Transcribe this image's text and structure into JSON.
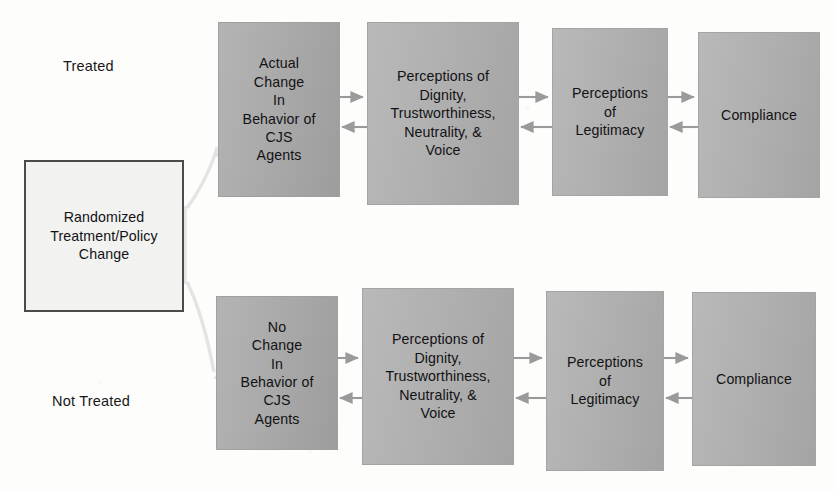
{
  "figure": {
    "title": "Randomized Treatment / Procedural Justice Legitimacy Model",
    "background_color": "#fdfdfc",
    "box_fill_color": "#aaaaaa",
    "box_border_color": "#a0a0a0",
    "source_box_fill_color": "#f2f2f0",
    "source_box_border_color": "#4b4b4b",
    "arrow_color": "#9a9a9a",
    "fork_line_color": "#e2e2e2",
    "text_color": "#121214"
  },
  "group_labels": {
    "treated": "Treated",
    "not_treated": "Not Treated"
  },
  "source": {
    "label": "Randomized\nTreatment/Policy\nChange",
    "line1": "Randomized",
    "line2": "Treatment/Policy",
    "line3": "Change"
  },
  "rows": [
    {
      "id": "treated-row",
      "group": "Treated",
      "nodes": [
        {
          "id": "treated-behavior",
          "label": "Actual\nChange\nIn\nBehavior of\nCJS\nAgents",
          "lines": [
            "Actual",
            "Change",
            "In",
            "Behavior of",
            "CJS",
            "Agents"
          ]
        },
        {
          "id": "treated-perceptions",
          "label": "Perceptions of\nDignity,\nTrustworthiness,\nNeutrality, &\nVoice",
          "lines": [
            "Perceptions of",
            "Dignity,",
            "Trustworthiness,",
            "Neutrality, &",
            "Voice"
          ]
        },
        {
          "id": "treated-legitimacy",
          "label": "Perceptions\nof\nLegitimacy",
          "lines": [
            "Perceptions",
            "of",
            "Legitimacy"
          ]
        },
        {
          "id": "treated-compliance",
          "label": "Compliance",
          "lines": [
            "Compliance"
          ]
        }
      ]
    },
    {
      "id": "not-treated-row",
      "group": "Not Treated",
      "nodes": [
        {
          "id": "untreated-behavior",
          "label": "No\nChange\nIn\nBehavior of\nCJS\nAgents",
          "lines": [
            "No",
            "Change",
            "In",
            "Behavior of",
            "CJS",
            "Agents"
          ]
        },
        {
          "id": "untreated-perceptions",
          "label": "Perceptions of\nDignity,\nTrustworthiness,\nNeutrality, &\nVoice",
          "lines": [
            "Perceptions of",
            "Dignity,",
            "Trustworthiness,",
            "Neutrality, &",
            "Voice"
          ]
        },
        {
          "id": "untreated-legitimacy",
          "label": "Perceptions\nof\nLegitimacy",
          "lines": [
            "Perceptions",
            "of",
            "Legitimacy"
          ]
        },
        {
          "id": "untreated-compliance",
          "label": "Compliance",
          "lines": [
            "Compliance"
          ]
        }
      ]
    }
  ],
  "connectors": {
    "bidirectional_pairs": [
      "behavior <-> perceptions",
      "perceptions <-> legitimacy",
      "legitimacy <-> compliance"
    ],
    "fork_from_source": [
      "to treated row",
      "to not treated row"
    ]
  }
}
